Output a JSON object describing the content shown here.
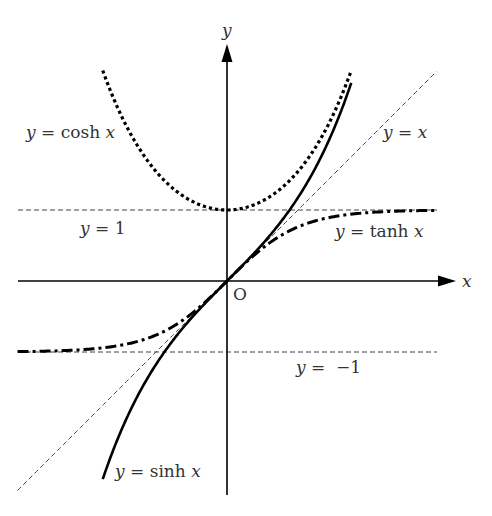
{
  "chart_data": {
    "type": "line",
    "title": "",
    "xlabel": "x",
    "ylabel": "y",
    "origin_label": "O",
    "xlim": [
      -2.95,
      3.2
    ],
    "ylim": [
      -3.0,
      3.35
    ],
    "grid": false,
    "legend": "none (inline labels)",
    "series": [
      {
        "name": "y = cosh x",
        "function": "cosh",
        "x_range": [
          -1.75,
          1.75
        ],
        "style": "dotted",
        "label": {
          "lhs": "y",
          "eq": " = cosh ",
          "var": "x"
        }
      },
      {
        "name": "y = sinh x",
        "function": "sinh",
        "x_range": [
          -1.75,
          1.75
        ],
        "style": "solid",
        "label": {
          "lhs": "y",
          "eq": " = sinh ",
          "var": "x"
        }
      },
      {
        "name": "y = tanh x",
        "function": "tanh",
        "x_range": [
          -2.95,
          2.95
        ],
        "style": "dash-dot",
        "label": {
          "lhs": "y",
          "eq": " = tanh ",
          "var": "x"
        }
      },
      {
        "name": "y = x",
        "function": "identity",
        "x_range": [
          -2.95,
          2.95
        ],
        "style": "thin-dashed",
        "label": {
          "lhs": "y",
          "eq": " = ",
          "var": "x"
        }
      }
    ],
    "asymptotes": [
      {
        "name": "y = 1",
        "y": 1,
        "label": {
          "lhs": "y",
          "eq": " = 1"
        }
      },
      {
        "name": "y = -1",
        "y": -1,
        "label": {
          "lhs": "y",
          "eq": " =  −1"
        }
      }
    ],
    "colors": {
      "ink": "#000000",
      "label": "#333333",
      "guide": "#444444"
    }
  }
}
